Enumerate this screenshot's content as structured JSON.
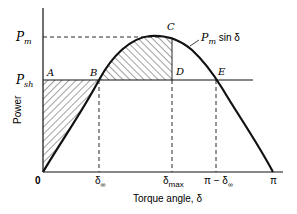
{
  "diagram": {
    "type": "power-angle curve (equal-area criterion)",
    "y_axis": {
      "label": "Power",
      "ticks": [
        {
          "label": "P",
          "sub": "m"
        },
        {
          "label": "P",
          "sub": "sh"
        }
      ]
    },
    "x_axis": {
      "label": "Torque angle, δ",
      "ticks": [
        {
          "label": "δ",
          "sub": "∞"
        },
        {
          "label": "δ",
          "sub": "max"
        },
        {
          "label": "π − δ",
          "sub": "∞"
        },
        {
          "label": "π"
        }
      ]
    },
    "origin_label": "0",
    "curve_label": {
      "p": "P",
      "sub": "m",
      "rest": " sin δ"
    },
    "points": {
      "A": "A",
      "B": "B",
      "C": "C",
      "D": "D",
      "E": "E"
    },
    "colors": {
      "ink": "#111111",
      "background": "#ffffff"
    }
  }
}
